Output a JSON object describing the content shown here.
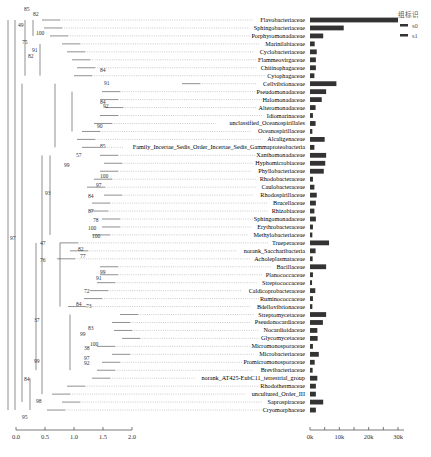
{
  "chart_data": {
    "type": "tree_bar",
    "title": "",
    "legend": {
      "title": "组标识",
      "entries": [
        "s0",
        "s1"
      ],
      "position": "top-right"
    },
    "tree_axis": {
      "ticks": [
        "0.0",
        "0.5",
        "1.0",
        "1.5",
        "2.0"
      ],
      "range": [
        0,
        2.0
      ]
    },
    "bar_axis": {
      "ticks": [
        "0k",
        "10k",
        "20k",
        "30k"
      ],
      "range": [
        0,
        32000
      ]
    },
    "categories": [
      "Flavobacteriaceae",
      "Sphingobacteriaceae",
      "Porphyromonadaceae",
      "Marinilabiaceae",
      "Cyclobacteriaceae",
      "Flammeovirgaceae",
      "Chitinophagaceae",
      "Cytophagaceae",
      "Cellvibrionaceae",
      "Pseudomonadaceae",
      "Halomonadaceae",
      "Alteromonadaceae",
      "Idiomarinaceae",
      "unclassified_Oceanospirillales",
      "Oceanospirillaceae",
      "Alcaligenaceae",
      "Family_Incertae_Sedis_Order_Incertae_Sedis_Gammaproteobacteria",
      "Xanthomonadaceae",
      "Hyphomicrobiaceae",
      "Phyllobacteriaceae",
      "Rhodobacteraceae",
      "Caulobacteraceae",
      "Rhodospirillaceae",
      "Brucellaceae",
      "Rhizobiaceae",
      "Sphingomonadaceae",
      "Erythrobacteraceae",
      "Methylobacteriaceae",
      "Trueperaceae",
      "norank_Saccharibacteria",
      "Acholeplasmataceae",
      "Bacillaceae",
      "Planococcaceae",
      "Streptococcaceae",
      "Caldicoprobacteraceae",
      "Ruminococcaceae",
      "Bdellovibrionaceae",
      "Streptomycetaceae",
      "Pseudonocardiaceae",
      "Nocardioidaceae",
      "Glycomycetaceae",
      "Micromonosporaceae",
      "Microbacteriaceae",
      "Promicromonosporaceae",
      "Brevibacteriaceae",
      "norank_AT425-EubC11_terrestrial_group",
      "Rhodothermaceae",
      "uncultured_Order_III",
      "Saprospiraceae",
      "Cryomorphaceae"
    ],
    "series": [
      {
        "name": "abundance",
        "values": [
          30000,
          11500,
          4500,
          1600,
          2300,
          2000,
          2000,
          1500,
          9000,
          5500,
          4000,
          1900,
          1000,
          1900,
          800,
          5000,
          1500,
          5500,
          5200,
          4700,
          1000,
          1500,
          2300,
          2000,
          1500,
          2000,
          1000,
          800,
          6500,
          1900,
          900,
          5500,
          1000,
          700,
          1800,
          1000,
          800,
          5500,
          4400,
          2500,
          2600,
          1000,
          3000,
          1600,
          900,
          2500,
          2000,
          2000,
          4500,
          2000
        ]
      }
    ],
    "bootstrap_labels": [
      "85",
      "82",
      "49",
      "100",
      "75",
      "91",
      "82",
      "84",
      "91",
      "84",
      "92",
      "90",
      "85",
      "57",
      "99",
      "100",
      "97",
      "84",
      "87",
      "78",
      "100",
      "100",
      "93",
      "47",
      "82",
      "77",
      "76",
      "99",
      "91",
      "72",
      "73",
      "84",
      "37",
      "83",
      "99",
      "100",
      "38",
      "97",
      "92",
      "99",
      "84",
      "98",
      "95",
      "97"
    ]
  }
}
